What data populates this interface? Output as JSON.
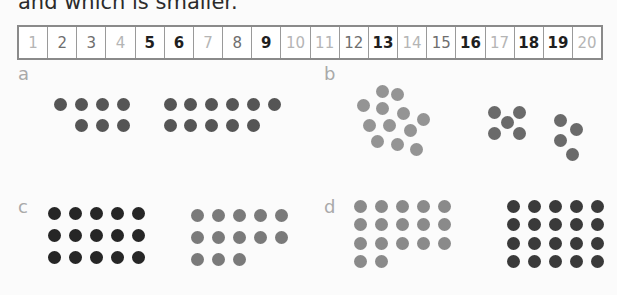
{
  "header": {
    "text": "and which is smaller."
  },
  "number_track": {
    "cells": [
      {
        "n": "1",
        "shade": "light"
      },
      {
        "n": "2",
        "shade": "mid"
      },
      {
        "n": "3",
        "shade": "mid"
      },
      {
        "n": "4",
        "shade": "light"
      },
      {
        "n": "5",
        "shade": "dark"
      },
      {
        "n": "6",
        "shade": "dark"
      },
      {
        "n": "7",
        "shade": "light"
      },
      {
        "n": "8",
        "shade": "mid"
      },
      {
        "n": "9",
        "shade": "dark"
      },
      {
        "n": "10",
        "shade": "light"
      },
      {
        "n": "11",
        "shade": "light"
      },
      {
        "n": "12",
        "shade": "mid"
      },
      {
        "n": "13",
        "shade": "dark"
      },
      {
        "n": "14",
        "shade": "light"
      },
      {
        "n": "15",
        "shade": "mid"
      },
      {
        "n": "16",
        "shade": "dark"
      },
      {
        "n": "17",
        "shade": "light"
      },
      {
        "n": "18",
        "shade": "dark"
      },
      {
        "n": "19",
        "shade": "dark"
      },
      {
        "n": "20",
        "shade": "light"
      }
    ]
  },
  "colors": {
    "dot_dark": "#2a2a2a",
    "dot_darkgrey": "#555555",
    "dot_grey": "#777777",
    "dot_lightgrey": "#949494",
    "label": "#a9a9a9"
  },
  "panels": [
    {
      "label": "a",
      "groups": [
        {
          "count": 7,
          "color": "#555555"
        },
        {
          "count": 11,
          "color": "#555555"
        }
      ]
    },
    {
      "label": "b",
      "groups": [
        {
          "count": 12,
          "color": "#949494"
        },
        {
          "count": 5,
          "color": "#6a6a6a"
        },
        {
          "count": 4,
          "color": "#6a6a6a"
        }
      ]
    },
    {
      "label": "c",
      "groups": [
        {
          "count": 15,
          "color": "#262626"
        },
        {
          "count": 13,
          "color": "#7a7a7a"
        }
      ]
    },
    {
      "label": "d",
      "groups": [
        {
          "count": 17,
          "color": "#8a8a8a"
        },
        {
          "count": 20,
          "color": "#3a3a3a"
        }
      ]
    }
  ]
}
